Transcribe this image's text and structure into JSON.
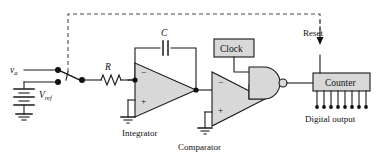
{
  "figure": {
    "labels": {
      "input_signal": "v",
      "input_signal_sub": "a",
      "reference": "V",
      "reference_sub": "ref",
      "resistor": "R",
      "capacitor": "C",
      "integrator": "Integrator",
      "comparator": "Comparator",
      "clock": "Clock",
      "counter": "Counter",
      "reset": "Reset",
      "digital_output": "Digital output",
      "opamp_minus": "−",
      "opamp_plus": "+"
    },
    "counts": {
      "digital_output_pins": 8
    },
    "colors": {
      "wire": "#1a1a1a",
      "dashed_feedback": "#4a4a4a",
      "component_fill": "#d8d8d8",
      "background": "#ffffff",
      "text": "#111111"
    }
  }
}
